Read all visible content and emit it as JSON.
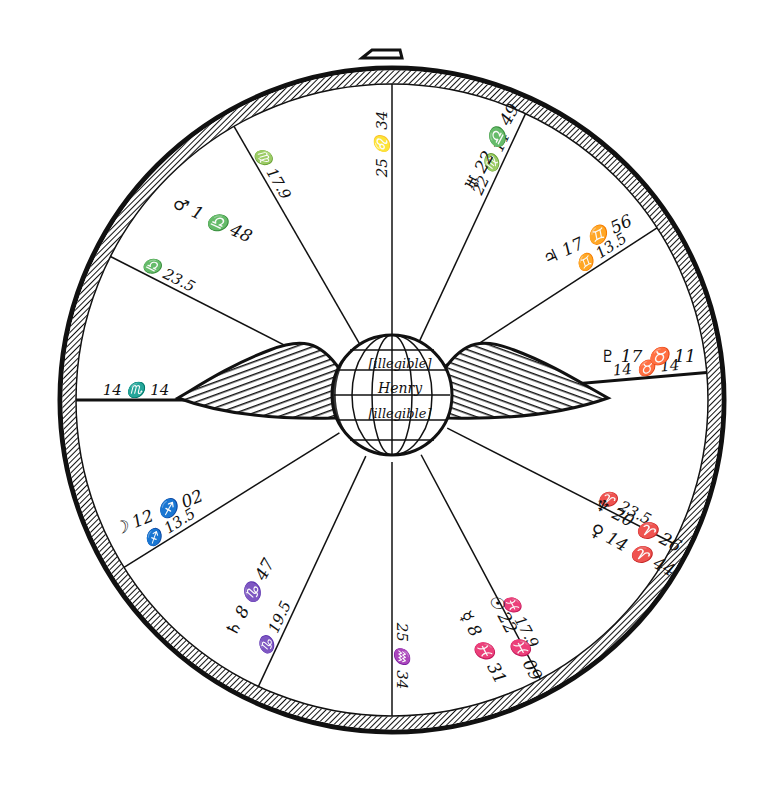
{
  "diagram": {
    "type": "astrological-horoscope-wheel",
    "center": [
      392,
      400
    ],
    "outer_radius": 330,
    "inner_radius": 62,
    "colors": {
      "ink": "#111111",
      "paper": "#ffffff"
    },
    "center_emblem": {
      "type": "winged-globe",
      "name_lines": [
        "[illegible]",
        "Henry",
        "[illegible]"
      ]
    },
    "cusps": [
      {
        "house": 10,
        "angle": 0,
        "label": "25 ♌ 34"
      },
      {
        "house": 11,
        "angle": 25,
        "label": "22 ♍ 14"
      },
      {
        "house": 12,
        "angle": 57,
        "label": "♊ 13.5"
      },
      {
        "house": 1,
        "angle": 85,
        "label": "14 ♉ 14"
      },
      {
        "house": 2,
        "angle": 117,
        "label": "♈ 23.5"
      },
      {
        "house": 3,
        "angle": 152,
        "label": "♓ 17.9"
      },
      {
        "house": 4,
        "angle": 180,
        "label": "25 ♒ 34"
      },
      {
        "house": 5,
        "angle": 205,
        "label": "♑ 19.5"
      },
      {
        "house": 6,
        "angle": 238,
        "label": "♐ 13.5"
      },
      {
        "house": 7,
        "angle": 270,
        "label": "14 ♏ 14"
      },
      {
        "house": 8,
        "angle": 297,
        "label": "♎ 23.5"
      },
      {
        "house": 9,
        "angle": 330,
        "label": "♍ 17.9"
      }
    ],
    "planets": [
      {
        "name": "Uranus",
        "glyph": "♅",
        "label": "♅ 22 ♎ 49",
        "pos": [
          497,
          150
        ],
        "rot": -62
      },
      {
        "name": "Jupiter",
        "glyph": "♃",
        "label": "♃ 17 ♊ 56",
        "pos": [
          590,
          245
        ],
        "rot": -25
      },
      {
        "name": "Pluto",
        "glyph": "♇",
        "label": "♇ 17 ♉ 11",
        "pos": [
          648,
          362
        ],
        "rot": 0
      },
      {
        "name": "Neptune",
        "glyph": "♆",
        "label": "♆ 20 ♈ 26",
        "pos": [
          635,
          530
        ],
        "rot": 28
      },
      {
        "name": "Venus",
        "glyph": "♀",
        "label": "♀ 14 ♈ 44",
        "pos": [
          630,
          555
        ],
        "rot": 28
      },
      {
        "name": "Sun",
        "glyph": "☉",
        "label": "☉ 22 ♓ 09",
        "pos": [
          510,
          640
        ],
        "rot": 62
      },
      {
        "name": "Mercury",
        "glyph": "☿",
        "label": "☿ 8 ♓ 31",
        "pos": [
          478,
          650
        ],
        "rot": 62
      },
      {
        "name": "Saturn",
        "glyph": "♄",
        "label": "♄ 8 ♑ 47",
        "pos": [
          255,
          600
        ],
        "rot": -62
      },
      {
        "name": "Moon",
        "glyph": "☽",
        "label": "☽ 12 ♐ 02",
        "pos": [
          160,
          518
        ],
        "rot": -22
      },
      {
        "name": "Mars",
        "glyph": "♂",
        "label": "♂ 1 ♎ 48",
        "pos": [
          210,
          225
        ],
        "rot": 25
      }
    ]
  }
}
